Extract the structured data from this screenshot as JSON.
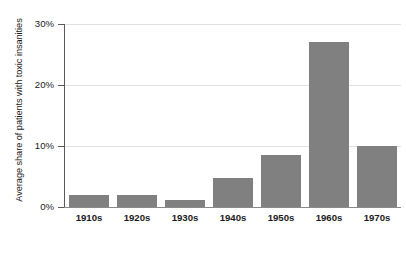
{
  "chart_data": {
    "type": "bar",
    "title": "",
    "xlabel": "",
    "ylabel": "Average share of patients with toxic insanities",
    "categories": [
      "1910s",
      "1920s",
      "1930s",
      "1940s",
      "1950s",
      "1960s",
      "1970s"
    ],
    "values": [
      2.0,
      2.0,
      1.2,
      4.7,
      8.6,
      27.0,
      10.0
    ],
    "ytick_labels": [
      "0%",
      "10%",
      "20%",
      "30%"
    ],
    "ytick_values": [
      0,
      10,
      20,
      30
    ],
    "ylim": [
      0,
      30
    ],
    "grid": true,
    "legend": false,
    "bar_color": "#808080",
    "gridline_color": "#e0e0e0",
    "axis_color": "#5a5a5a",
    "background_color": "#ffffff"
  }
}
